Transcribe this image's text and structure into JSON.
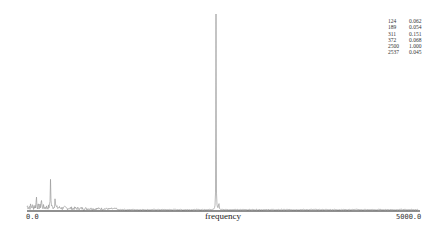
{
  "chart_data": {
    "type": "line",
    "title": "",
    "xlabel": "frequency",
    "ylabel": "",
    "xlim": [
      0.0,
      5000.0
    ],
    "ylim": [
      0,
      1.0
    ],
    "x_tick_labels": [
      "0.0",
      "5000.0"
    ],
    "grid": false,
    "legend": null,
    "series": [
      {
        "name": "spectrum",
        "color": "#9a9a9a",
        "peaks": [
          {
            "frequency": 124,
            "amplitude": 0.062
          },
          {
            "frequency": 189,
            "amplitude": 0.054
          },
          {
            "frequency": 311,
            "amplitude": 0.151
          },
          {
            "frequency": 372,
            "amplitude": 0.068
          },
          {
            "frequency": 2500,
            "amplitude": 1.0
          },
          {
            "frequency": 2537,
            "amplitude": 0.045
          }
        ]
      }
    ],
    "peak_table": {
      "position": "top-right",
      "rows": [
        [
          "124",
          "0.062"
        ],
        [
          "189",
          "0.054"
        ],
        [
          "311",
          "0.151"
        ],
        [
          "372",
          "0.068"
        ],
        [
          "2500",
          "1.000"
        ],
        [
          "2537",
          "0.045"
        ]
      ]
    }
  },
  "axis": {
    "x_min_label": "0.0",
    "x_max_label": "5000.0",
    "x_title": "frequency"
  },
  "colors": {
    "line": "#9a9a9a",
    "axis": "#222222",
    "background": "#ffffff"
  }
}
